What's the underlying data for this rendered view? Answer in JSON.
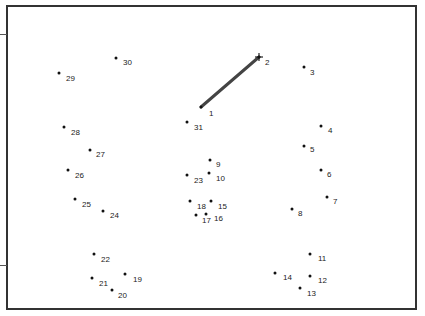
{
  "puzzle": {
    "type": "connect-the-dots",
    "current_point": 2,
    "total_points": 31,
    "line_color": "#444444",
    "points": [
      {
        "n": "1",
        "x": 201,
        "y": 107,
        "lx": 209,
        "ly": 110
      },
      {
        "n": "2",
        "x": 259,
        "y": 57,
        "lx": 265,
        "ly": 59
      },
      {
        "n": "3",
        "x": 304,
        "y": 67,
        "lx": 310,
        "ly": 69
      },
      {
        "n": "4",
        "x": 321,
        "y": 126,
        "lx": 328,
        "ly": 127
      },
      {
        "n": "5",
        "x": 304,
        "y": 146,
        "lx": 310,
        "ly": 146
      },
      {
        "n": "6",
        "x": 321,
        "y": 170,
        "lx": 327,
        "ly": 171
      },
      {
        "n": "7",
        "x": 327,
        "y": 197,
        "lx": 333,
        "ly": 198
      },
      {
        "n": "8",
        "x": 292,
        "y": 209,
        "lx": 298,
        "ly": 210
      },
      {
        "n": "9",
        "x": 210,
        "y": 160,
        "lx": 216,
        "ly": 161
      },
      {
        "n": "10",
        "x": 209,
        "y": 173,
        "lx": 216,
        "ly": 175
      },
      {
        "n": "11",
        "x": 310,
        "y": 254,
        "lx": 318,
        "ly": 255
      },
      {
        "n": "12",
        "x": 310,
        "y": 276,
        "lx": 318,
        "ly": 277
      },
      {
        "n": "13",
        "x": 300,
        "y": 288,
        "lx": 307,
        "ly": 290
      },
      {
        "n": "14",
        "x": 275,
        "y": 273,
        "lx": 283,
        "ly": 274
      },
      {
        "n": "15",
        "x": 211,
        "y": 201,
        "lx": 218,
        "ly": 203
      },
      {
        "n": "16",
        "x": 206,
        "y": 214,
        "lx": 214,
        "ly": 215
      },
      {
        "n": "17",
        "x": 196,
        "y": 215,
        "lx": 202,
        "ly": 217
      },
      {
        "n": "18",
        "x": 190,
        "y": 201,
        "lx": 197,
        "ly": 203
      },
      {
        "n": "19",
        "x": 125,
        "y": 274,
        "lx": 133,
        "ly": 276
      },
      {
        "n": "20",
        "x": 112,
        "y": 290,
        "lx": 118,
        "ly": 292
      },
      {
        "n": "21",
        "x": 92,
        "y": 278,
        "lx": 99,
        "ly": 280
      },
      {
        "n": "22",
        "x": 94,
        "y": 254,
        "lx": 101,
        "ly": 256
      },
      {
        "n": "23",
        "x": 187,
        "y": 175,
        "lx": 194,
        "ly": 177
      },
      {
        "n": "24",
        "x": 103,
        "y": 211,
        "lx": 110,
        "ly": 212
      },
      {
        "n": "25",
        "x": 75,
        "y": 199,
        "lx": 82,
        "ly": 201
      },
      {
        "n": "26",
        "x": 68,
        "y": 170,
        "lx": 75,
        "ly": 172
      },
      {
        "n": "27",
        "x": 90,
        "y": 150,
        "lx": 96,
        "ly": 151
      },
      {
        "n": "28",
        "x": 64,
        "y": 127,
        "lx": 71,
        "ly": 129
      },
      {
        "n": "29",
        "x": 59,
        "y": 73,
        "lx": 66,
        "ly": 75
      },
      {
        "n": "30",
        "x": 116,
        "y": 58,
        "lx": 123,
        "ly": 59
      },
      {
        "n": "31",
        "x": 187,
        "y": 122,
        "lx": 194,
        "ly": 124
      }
    ],
    "drawn_segments": [
      {
        "from": "1",
        "to": "2"
      }
    ]
  }
}
